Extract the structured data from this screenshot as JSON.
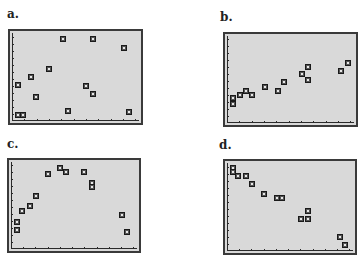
{
  "panels": [
    {
      "id": "a",
      "label": "a."
    },
    {
      "id": "b",
      "label": "b."
    },
    {
      "id": "c",
      "label": "c."
    },
    {
      "id": "d",
      "label": "d."
    }
  ],
  "chart_data": [
    {
      "type": "scatter",
      "title": "a.",
      "xlabel": "",
      "ylabel": "",
      "xlim": [
        0,
        10
      ],
      "ylim": [
        0,
        10
      ],
      "grid": false,
      "x_ticks": 10,
      "y_ticks": 12,
      "points": [
        {
          "x": 0.5,
          "y": 4.1
        },
        {
          "x": 0.5,
          "y": 0.7
        },
        {
          "x": 0.9,
          "y": 0.7
        },
        {
          "x": 1.5,
          "y": 5.0
        },
        {
          "x": 1.9,
          "y": 2.7
        },
        {
          "x": 2.9,
          "y": 5.9
        },
        {
          "x": 4.0,
          "y": 9.3
        },
        {
          "x": 4.4,
          "y": 1.1
        },
        {
          "x": 5.8,
          "y": 4.0
        },
        {
          "x": 6.4,
          "y": 9.3
        },
        {
          "x": 6.4,
          "y": 3.1
        },
        {
          "x": 8.8,
          "y": 8.3
        },
        {
          "x": 9.2,
          "y": 1.0
        }
      ]
    },
    {
      "type": "scatter",
      "title": "b.",
      "xlabel": "",
      "ylabel": "",
      "xlim": [
        0,
        10
      ],
      "ylim": [
        0,
        10
      ],
      "grid": false,
      "x_ticks": 10,
      "y_ticks": 12,
      "points": [
        {
          "x": 0.5,
          "y": 2.2
        },
        {
          "x": 0.5,
          "y": 2.9
        },
        {
          "x": 1.0,
          "y": 3.2
        },
        {
          "x": 1.5,
          "y": 3.7
        },
        {
          "x": 2.0,
          "y": 3.2
        },
        {
          "x": 3.0,
          "y": 4.1
        },
        {
          "x": 4.0,
          "y": 3.7
        },
        {
          "x": 4.5,
          "y": 4.7
        },
        {
          "x": 5.9,
          "y": 5.6
        },
        {
          "x": 6.4,
          "y": 6.4
        },
        {
          "x": 6.4,
          "y": 5.0
        },
        {
          "x": 9.0,
          "y": 6.0
        },
        {
          "x": 9.5,
          "y": 6.9
        }
      ]
    },
    {
      "type": "scatter",
      "title": "c.",
      "xlabel": "",
      "ylabel": "",
      "xlim": [
        0,
        10
      ],
      "ylim": [
        0,
        10
      ],
      "grid": false,
      "x_ticks": 10,
      "y_ticks": 12,
      "points": [
        {
          "x": 0.5,
          "y": 2.2
        },
        {
          "x": 0.5,
          "y": 3.1
        },
        {
          "x": 0.9,
          "y": 4.4
        },
        {
          "x": 1.5,
          "y": 4.9
        },
        {
          "x": 2.0,
          "y": 6.1
        },
        {
          "x": 2.9,
          "y": 8.6
        },
        {
          "x": 3.9,
          "y": 9.3
        },
        {
          "x": 4.4,
          "y": 8.9
        },
        {
          "x": 5.8,
          "y": 8.9
        },
        {
          "x": 6.4,
          "y": 7.6
        },
        {
          "x": 6.4,
          "y": 7.1
        },
        {
          "x": 8.8,
          "y": 3.9
        },
        {
          "x": 9.2,
          "y": 2.0
        }
      ]
    },
    {
      "type": "scatter",
      "title": "d.",
      "xlabel": "",
      "ylabel": "",
      "xlim": [
        0,
        10
      ],
      "ylim": [
        0,
        10
      ],
      "grid": false,
      "x_ticks": 10,
      "y_ticks": 12,
      "points": [
        {
          "x": 0.5,
          "y": 9.4
        },
        {
          "x": 0.5,
          "y": 9.0
        },
        {
          "x": 0.9,
          "y": 8.5
        },
        {
          "x": 1.5,
          "y": 8.5
        },
        {
          "x": 2.0,
          "y": 7.6
        },
        {
          "x": 2.9,
          "y": 6.5
        },
        {
          "x": 4.0,
          "y": 6.0
        },
        {
          "x": 4.4,
          "y": 6.0
        },
        {
          "x": 5.9,
          "y": 3.6
        },
        {
          "x": 6.4,
          "y": 4.6
        },
        {
          "x": 6.4,
          "y": 3.6
        },
        {
          "x": 9.0,
          "y": 1.6
        },
        {
          "x": 9.4,
          "y": 0.7
        }
      ]
    }
  ],
  "colors": {
    "plot_background": "#d9d9d9",
    "frame": "#3a3a3a",
    "marker_border": "#1a1a1a",
    "label": "#222222"
  }
}
